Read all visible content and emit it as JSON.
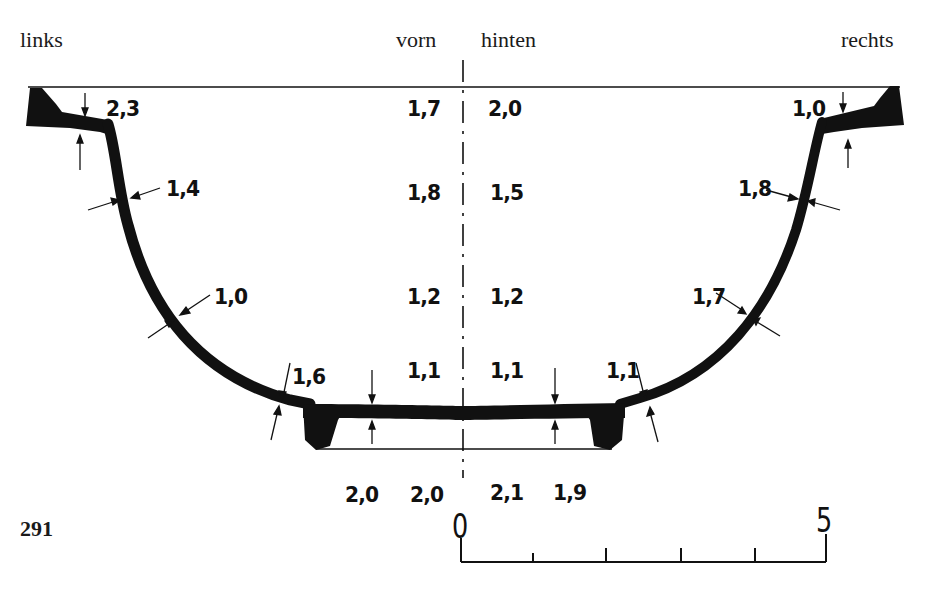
{
  "figure": {
    "number": "291",
    "headers": {
      "left": "links",
      "front": "vorn",
      "back": "hinten",
      "right": "rechts"
    }
  },
  "thickness_labels": {
    "left_rim": "2,3",
    "left_upper_wall": "1,4",
    "left_mid_wall": "1,0",
    "left_lower_wall": "1,6",
    "right_rim": "1,0",
    "right_upper_wall": "1,8",
    "right_mid_wall": "1,7",
    "right_lower_wall": "1,1",
    "center_front": [
      "1,7",
      "1,8",
      "1,2",
      "1,1"
    ],
    "center_back": [
      "2,0",
      "1,5",
      "1,2",
      "1,1"
    ],
    "floor": [
      "2,0",
      "2,0",
      "2,1",
      "1,9"
    ]
  },
  "scale_bar": {
    "start": "0",
    "end": "5",
    "ticks": 5
  },
  "colors": {
    "ink": "#111111",
    "background": "#ffffff"
  }
}
